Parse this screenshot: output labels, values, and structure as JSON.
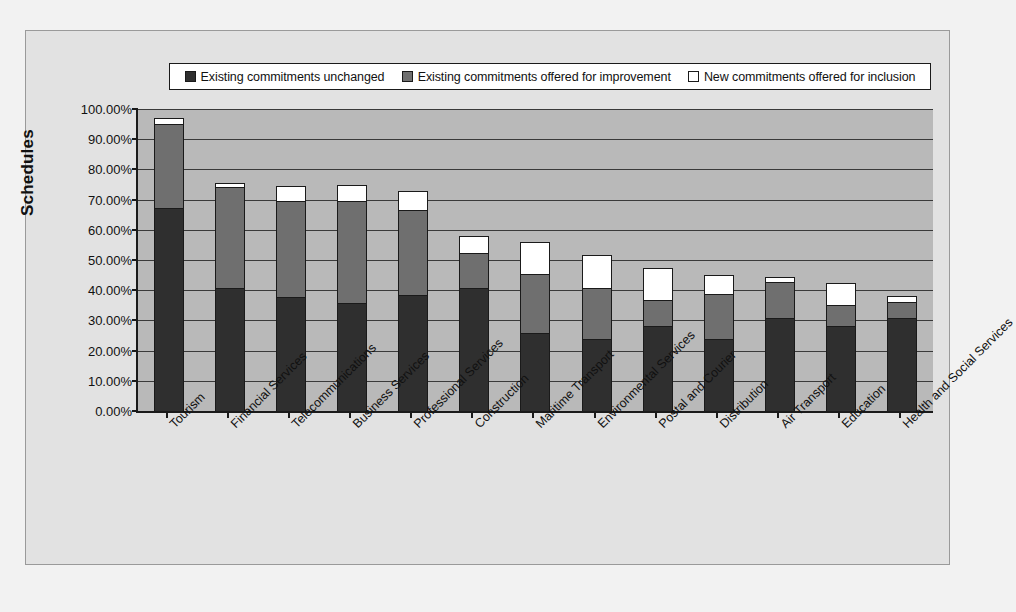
{
  "chart_data": {
    "type": "bar",
    "subtype": "stacked-bar",
    "title": "",
    "xlabel": "",
    "ylabel": "Schedules",
    "ylim": [
      0,
      100
    ],
    "ytick_labels": [
      "100.00%",
      "90.00%",
      "80.00%",
      "70.00%",
      "60.00%",
      "50.00%",
      "40.00%",
      "30.00%",
      "20.00%",
      "10.00%",
      "0.00%"
    ],
    "ytick_values": [
      100,
      90,
      80,
      70,
      60,
      50,
      40,
      30,
      20,
      10,
      0
    ],
    "grid": true,
    "legend_position": "top",
    "categories": [
      "Tourism",
      "Financial Services",
      "Telecommunications",
      "Business Services",
      "Professional Services",
      "Construction",
      "Maritime Transport",
      "Environmental Services",
      "Postal and Courier",
      "Distribution",
      "Air Transport",
      "Education",
      "Health and Social Services"
    ],
    "series": [
      {
        "name": "Existing commitments unchanged",
        "color": "#2f2f2f",
        "values": [
          67.5,
          41.0,
          38.0,
          36.0,
          38.5,
          41.0,
          26.0,
          24.0,
          28.5,
          24.0,
          31.0,
          28.5,
          31.0
        ]
      },
      {
        "name": "Existing commitments offered for improvement",
        "color": "#6f6f6f",
        "values": [
          28.0,
          33.5,
          32.0,
          34.0,
          28.5,
          11.5,
          19.5,
          17.0,
          8.5,
          15.0,
          12.0,
          7.0,
          5.5
        ]
      },
      {
        "name": "New commitments offered for inclusion",
        "color": "#ffffff",
        "values": [
          1.5,
          1.0,
          4.5,
          5.0,
          6.0,
          5.5,
          10.5,
          10.5,
          10.5,
          6.0,
          1.5,
          7.0,
          1.5
        ]
      }
    ],
    "totals": [
      97.0,
      75.5,
      74.5,
      75.0,
      73.0,
      58.0,
      56.0,
      51.5,
      47.5,
      45.0,
      44.5,
      42.5,
      38.0
    ]
  },
  "legend": {
    "entries": [
      {
        "label": "Existing commitments unchanged",
        "color": "#2f2f2f"
      },
      {
        "label": "Existing commitments offered for improvement",
        "color": "#6f6f6f"
      },
      {
        "label": "New commitments offered for inclusion",
        "color": "#ffffff"
      }
    ]
  },
  "axis": {
    "y_title": "Schedules"
  },
  "colors": {
    "plot_background": "#b9b9b9",
    "figure_background": "#e2e2e2",
    "page_background": "#f2f2f2",
    "axis": "#1a1a1a",
    "gridline": "#3a3a3a"
  }
}
